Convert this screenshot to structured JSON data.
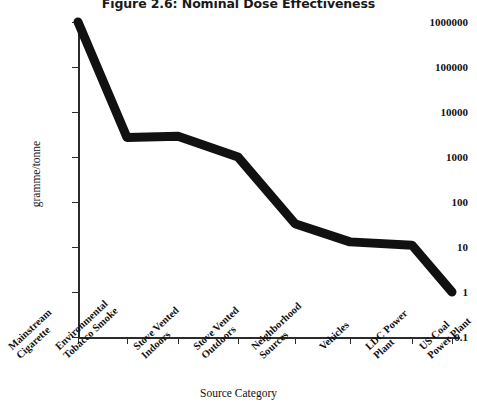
{
  "chart_data": {
    "type": "line",
    "title": "Figure 2.6: Nominal Dose Effectiveness",
    "xlabel": "Source Category",
    "ylabel": "gramme/tonne",
    "yscale": "log",
    "ylim": [
      0.1,
      1000000
    ],
    "ytick_labels": [
      "1000000",
      "100000",
      "10000",
      "1000",
      "100",
      "10",
      "1",
      "0.1"
    ],
    "ytick_values": [
      1000000,
      100000,
      10000,
      1000,
      100,
      10,
      1,
      0.1
    ],
    "grid": false,
    "legend": "none",
    "line_color": "#111111",
    "categories": [
      "Mainstream Cigarette",
      "Environmental Tobacco Smoke",
      "Stove Vented Indoors",
      "Stove Vented Outdoors",
      "Neighborhood Sources",
      "Vehicles",
      "LDC Power Plant",
      "US Coal Power Plant"
    ],
    "category_lines": [
      [
        "Mainstream",
        "Cigarette"
      ],
      [
        "Environmental",
        "Tobacco Smoke"
      ],
      [
        "Stove Vented",
        "Indoors"
      ],
      [
        "Stove Vented",
        "Outdoors"
      ],
      [
        "Neighborhood",
        "Sources"
      ],
      [
        "Vehicles",
        ""
      ],
      [
        "LDC Power",
        "Plant"
      ],
      [
        "US Coal",
        "Power Plant"
      ]
    ],
    "values": [
      1000000,
      2700,
      2900,
      1000,
      33,
      13,
      11,
      1
    ]
  }
}
